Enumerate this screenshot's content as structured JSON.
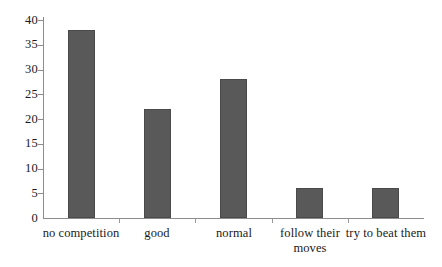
{
  "chart_data": {
    "type": "bar",
    "title": "",
    "subtitle": "",
    "xlabel": "",
    "ylabel": "",
    "categories": [
      "no competition",
      "good",
      "normal",
      "follow their\nmoves",
      "try to beat them"
    ],
    "values": [
      38,
      22,
      28,
      6,
      6
    ],
    "ylim": [
      0,
      40
    ],
    "y_ticks": [
      "0",
      "5",
      "10",
      "15",
      "20",
      "25",
      "30",
      "35",
      "40"
    ],
    "y_tick_values": [
      0,
      5,
      10,
      15,
      20,
      25,
      30,
      35,
      40
    ],
    "grid": false,
    "legend": null,
    "legend_position": "none",
    "annotations": [],
    "colors": {
      "bar_fill": "#595959",
      "bar_edge": "#4a4a4a",
      "axis": "#8c8c8c",
      "text": "#1a1a1a",
      "background": "#ffffff"
    }
  }
}
